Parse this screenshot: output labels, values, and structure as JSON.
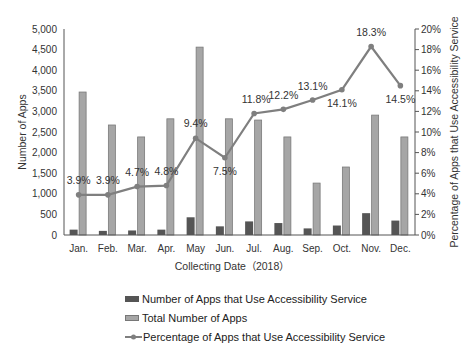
{
  "chart_data": {
    "type": "bar",
    "categories": [
      "Jan.",
      "Feb.",
      "Mar.",
      "Apr.",
      "May",
      "Jun.",
      "Jul.",
      "Aug.",
      "Sep.",
      "Oct.",
      "Nov.",
      "Dec."
    ],
    "series": [
      {
        "name": "Number of Apps that Use Accessibility Service",
        "type": "bar",
        "axis": "left",
        "color": "#555555",
        "values": [
          130,
          100,
          110,
          130,
          430,
          210,
          330,
          290,
          160,
          230,
          530,
          350
        ]
      },
      {
        "name": "Total Number of Apps",
        "type": "bar",
        "axis": "left",
        "color": "#a6a6a6",
        "values": [
          3470,
          2670,
          2380,
          2820,
          4560,
          2820,
          2790,
          2380,
          1260,
          1650,
          2910,
          2380
        ]
      },
      {
        "name": "Percentage of Apps that Use Accessibility Service",
        "type": "line",
        "axis": "right",
        "color": "#7f7f7f",
        "values": [
          3.9,
          3.9,
          4.7,
          4.8,
          9.4,
          7.5,
          11.8,
          12.2,
          13.1,
          14.1,
          18.3,
          14.5
        ],
        "labels": [
          "3.9%",
          "3.9%",
          "4.7%",
          "4.8%",
          "9.4%",
          "7.5%",
          "11.8%",
          "12.2%",
          "13.1%",
          "14.1%",
          "18.3%",
          "14.5%"
        ]
      }
    ],
    "xlabel": "Collecting Date（2018）",
    "ylabel": "Number of Apps",
    "ylabel_right": "Percentage of Apps that Use Accessibility Service",
    "ylim": [
      0,
      5000
    ],
    "ylim_right": [
      0,
      20
    ],
    "yticks": [
      "0",
      "500",
      "1,000",
      "1,500",
      "2,000",
      "2,500",
      "3,000",
      "3,500",
      "4,000",
      "4,500",
      "5,000"
    ],
    "yticks_right": [
      "0%",
      "2%",
      "4%",
      "6%",
      "8%",
      "10%",
      "12%",
      "14%",
      "16%",
      "18%",
      "20%"
    ],
    "grid": false,
    "legend_position": "bottom"
  },
  "legend": {
    "items": [
      {
        "label": "Number of Apps that Use Accessibility Service",
        "color": "#555555",
        "kind": "bar"
      },
      {
        "label": "Total Number of Apps",
        "color": "#a6a6a6",
        "kind": "bar"
      },
      {
        "label": "Percentage of Apps that Use Accessibility Service",
        "color": "#7f7f7f",
        "kind": "line"
      }
    ]
  }
}
